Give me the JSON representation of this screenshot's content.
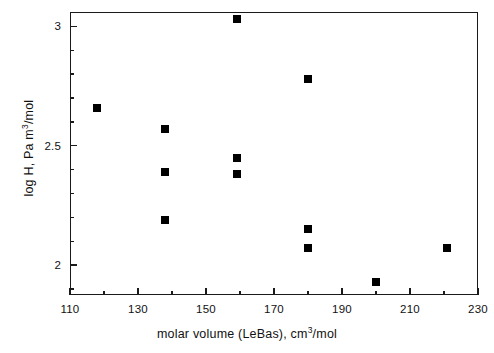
{
  "chart_data": {
    "type": "scatter",
    "title": "",
    "xlabel": "molar volume (LeBas), cm³/mol",
    "ylabel": "log H, Pa m³/mol",
    "xlabel_parts": {
      "pre": "molar volume (LeBas), cm",
      "sup": "3",
      "post": "/mol"
    },
    "ylabel_parts": {
      "pre": "log H, Pa m",
      "sup": "3",
      "post": "/mol"
    },
    "xlim": [
      110,
      230
    ],
    "ylim": [
      1.875,
      3.06
    ],
    "xticks": [
      110,
      130,
      150,
      170,
      190,
      210,
      230
    ],
    "xticklabels": [
      "110",
      "130",
      "150",
      "170",
      "190",
      "210",
      "230"
    ],
    "yticks": [
      2.0,
      2.5,
      3.0
    ],
    "yticklabels": [
      "2",
      "2.5",
      "3"
    ],
    "x_minor_tick_step": 10,
    "y_minor_tick_step": 0.1,
    "grid": false,
    "legend": false,
    "marker": "square",
    "marker_color": "#000000",
    "marker_size_px": 8,
    "points": [
      {
        "x": 118,
        "y": 2.66
      },
      {
        "x": 138,
        "y": 2.57
      },
      {
        "x": 138,
        "y": 2.39
      },
      {
        "x": 138,
        "y": 2.19
      },
      {
        "x": 159,
        "y": 3.03
      },
      {
        "x": 159,
        "y": 2.45
      },
      {
        "x": 159,
        "y": 2.38
      },
      {
        "x": 180,
        "y": 2.78
      },
      {
        "x": 180,
        "y": 2.15
      },
      {
        "x": 180,
        "y": 2.07
      },
      {
        "x": 200,
        "y": 1.93
      },
      {
        "x": 221,
        "y": 2.07
      }
    ]
  }
}
